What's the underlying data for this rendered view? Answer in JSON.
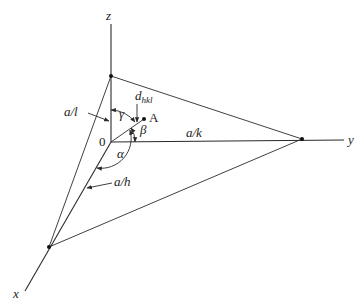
{
  "diagram": {
    "type": "crystallographic-plane",
    "axes": {
      "x_label": "x",
      "y_label": "y",
      "z_label": "z"
    },
    "origin_label": "0",
    "intercepts": {
      "x": "a/h",
      "y": "a/k",
      "z": "a/l"
    },
    "normal": {
      "point_label": "A",
      "distance_label": "d",
      "distance_subscript": "hkl"
    },
    "angles": {
      "alpha": "α",
      "beta": "β",
      "gamma": "γ"
    }
  }
}
